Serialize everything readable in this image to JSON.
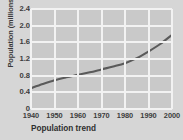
{
  "chart_data": {
    "type": "line",
    "title": "Population trend",
    "xlabel": "",
    "ylabel": "Population (millions)",
    "x": [
      1940,
      1945,
      1950,
      1955,
      1960,
      1965,
      1970,
      1975,
      1980,
      1985,
      1990,
      1995,
      2000
    ],
    "values": [
      0.5,
      0.6,
      0.69,
      0.76,
      0.82,
      0.88,
      0.95,
      1.02,
      1.1,
      1.22,
      1.38,
      1.56,
      1.78
    ],
    "series": [
      {
        "name": "Population",
        "values": [
          0.5,
          0.6,
          0.69,
          0.76,
          0.82,
          0.88,
          0.95,
          1.02,
          1.1,
          1.22,
          1.38,
          1.56,
          1.78
        ]
      }
    ],
    "xticks": [
      1940,
      1950,
      1960,
      1970,
      1980,
      1990,
      2000
    ],
    "xticklabels": [
      "1940",
      "1950",
      "1960",
      "1970",
      "1980",
      "1990",
      "2000"
    ],
    "yticks": [
      0,
      0.4,
      0.8,
      1.2,
      1.6,
      2.0,
      2.4
    ],
    "yticklabels": [
      "0",
      "0.4",
      "0.8",
      "1.2",
      "1.6",
      "2.0",
      "2.4"
    ],
    "xlim": [
      1940,
      2000
    ],
    "ylim": [
      0,
      2.4
    ],
    "grid": true,
    "legend": false,
    "line_color": "#5a5a5a",
    "plot_background": "#c9c9c9",
    "grid_color": "#f2f2f2",
    "figure_background": "#d6d6d6"
  }
}
